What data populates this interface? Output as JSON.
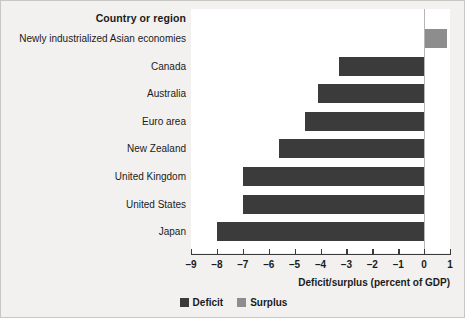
{
  "chart_data": {
    "type": "bar",
    "orientation": "horizontal",
    "title": "",
    "header_label": "Country or region",
    "categories": [
      "Newly industrialized Asian economies",
      "Canada",
      "Australia",
      "Euro area",
      "New Zealand",
      "United Kingdom",
      "United States",
      "Japan"
    ],
    "values": [
      0.9,
      -3.3,
      -4.1,
      -4.6,
      -5.6,
      -7.0,
      -7.0,
      -8.0
    ],
    "xlabel": "Deficit/surplus (percent of GDP)",
    "ylabel": "",
    "xlim": [
      -9,
      1
    ],
    "xticks": [
      -9,
      -8,
      -7,
      -6,
      -5,
      -4,
      -3,
      -2,
      -1,
      0,
      1
    ],
    "xticklabels": [
      "–9",
      "–8",
      "–7",
      "–6",
      "–5",
      "–4",
      "–3",
      "–2",
      "–1",
      "0",
      "1"
    ],
    "grid": false,
    "legend_position": "bottom",
    "legend": [
      {
        "label": "Deficit",
        "color": "#3b3b3b"
      },
      {
        "label": "Surplus",
        "color": "#8d8d8d"
      }
    ],
    "colors": {
      "deficit": "#3b3b3b",
      "surplus": "#8d8d8d",
      "figure_background": "#f2f1ef",
      "plot_background": "#ffffff",
      "axis": "#3b3b3b",
      "text": "#1b1b1b"
    }
  }
}
